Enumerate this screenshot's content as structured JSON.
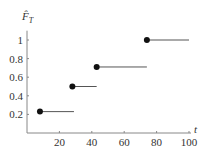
{
  "chart_data": {
    "type": "line",
    "subtype": "step-ecdf",
    "title": "",
    "ylabel": "F̂_T",
    "ylabel_main": "F̂",
    "ylabel_sub": "T",
    "xlabel": "t",
    "xlim": [
      0,
      100
    ],
    "ylim": [
      0,
      1.1
    ],
    "xticks": [
      20,
      40,
      60,
      80,
      100
    ],
    "yticks": [
      0.2,
      0.4,
      0.6,
      0.8,
      1
    ],
    "xtick_labels": [
      "20",
      "40",
      "60",
      "80",
      "100"
    ],
    "ytick_labels": [
      "0.2",
      "0.4",
      "0.6",
      "0.8",
      "1"
    ],
    "grid": false,
    "legend": null,
    "steps": [
      {
        "x_start": 8,
        "x_end": 29,
        "y": 0.23
      },
      {
        "x_start": 28,
        "x_end": 43,
        "y": 0.5
      },
      {
        "x_start": 43,
        "x_end": 74,
        "y": 0.71
      },
      {
        "x_start": 74,
        "x_end": 100,
        "y": 1.0
      }
    ]
  },
  "colors": {
    "axis": "#888888",
    "step": "#555555",
    "dot": "#111111",
    "text": "#333333"
  }
}
